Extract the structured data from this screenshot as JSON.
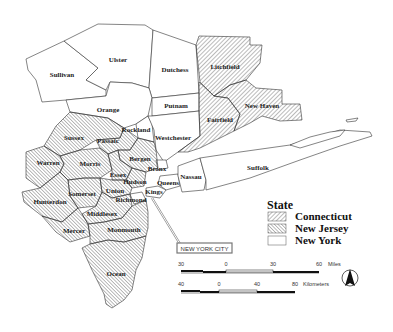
{
  "map": {
    "counties": {
      "new_york": [
        {
          "name": "Sullivan",
          "x": 62,
          "y": 76
        },
        {
          "name": "Ulster",
          "x": 118,
          "y": 61
        },
        {
          "name": "Dutchess",
          "x": 175,
          "y": 71
        },
        {
          "name": "Orange",
          "x": 108,
          "y": 111
        },
        {
          "name": "Putnam",
          "x": 176,
          "y": 107
        },
        {
          "name": "Rockland",
          "x": 136,
          "y": 131
        },
        {
          "name": "Westchester",
          "x": 173,
          "y": 139
        },
        {
          "name": "Suffolk",
          "x": 258,
          "y": 169
        },
        {
          "name": "Nassau",
          "x": 190,
          "y": 177
        },
        {
          "name": "Queens",
          "x": 168,
          "y": 184
        },
        {
          "name": "Bronx",
          "x": 157,
          "y": 170
        },
        {
          "name": "Kings",
          "x": 150,
          "y": 193
        },
        {
          "name": "Richmond",
          "x": 135,
          "y": 200
        }
      ],
      "connecticut": [
        {
          "name": "Litchfield",
          "x": 220,
          "y": 68
        },
        {
          "name": "New Haven",
          "x": 262,
          "y": 107
        },
        {
          "name": "Fairfield",
          "x": 218,
          "y": 121
        }
      ],
      "new_jersey": [
        {
          "name": "Sussex",
          "x": 78,
          "y": 139
        },
        {
          "name": "Passaic",
          "x": 105,
          "y": 142
        },
        {
          "name": "Warren",
          "x": 48,
          "y": 164
        },
        {
          "name": "Morris",
          "x": 90,
          "y": 165
        },
        {
          "name": "Bergen",
          "x": 138,
          "y": 160
        },
        {
          "name": "Essex",
          "x": 117,
          "y": 176
        },
        {
          "name": "Hudson",
          "x": 133,
          "y": 183
        },
        {
          "name": "Union",
          "x": 113,
          "y": 192
        },
        {
          "name": "Somerset",
          "x": 84,
          "y": 195
        },
        {
          "name": "Hunterdon",
          "x": 50,
          "y": 202
        },
        {
          "name": "Middlesex",
          "x": 100,
          "y": 214
        },
        {
          "name": "Mercer",
          "x": 75,
          "y": 231
        },
        {
          "name": "Monmouth",
          "x": 124,
          "y": 231
        },
        {
          "name": "Ocean",
          "x": 115,
          "y": 275
        }
      ]
    },
    "callout": {
      "label": "NEW YORK CITY"
    },
    "legend": {
      "title": "State",
      "items": [
        {
          "label": "Connecticut",
          "pattern": "diag-ne"
        },
        {
          "label": "New Jersey",
          "pattern": "diag-nw"
        },
        {
          "label": "New York",
          "pattern": "none"
        }
      ]
    },
    "scale": {
      "miles": {
        "ticks": [
          "30",
          "0",
          "30",
          "60"
        ],
        "unit": "Miles"
      },
      "kilometers": {
        "ticks": [
          "40",
          "0",
          "40",
          "80"
        ],
        "unit": "Kilometers"
      }
    },
    "north_arrow": {
      "icon": "north-arrow-icon"
    },
    "colors": {
      "stroke": "#333333",
      "hatch": "#555555",
      "fill": "#ffffff"
    }
  }
}
